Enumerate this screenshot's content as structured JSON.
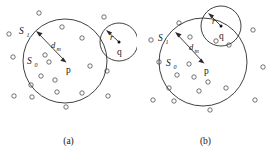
{
  "figure": {
    "background_color": "#ffffff",
    "stroke_color": "#2b2b2b",
    "text_color": "#141414",
    "width": 273,
    "height": 149,
    "panels": [
      {
        "id": "a",
        "caption": "(a)",
        "description": "Two disjoint circles: large neighborhood circle around point p and small circle of radius r around point q",
        "labels": {
          "set_outer": "S",
          "set_outer_sub": "1",
          "set_inner": "S",
          "set_inner_sub": "0",
          "distance": "d",
          "distance_sub": "m",
          "point_p": "p",
          "point_q": "q",
          "radius": "r"
        },
        "big_circle": {
          "cx": 65,
          "cy": 61,
          "r": 42
        },
        "small_circle": {
          "cx": 119,
          "cy": 42,
          "r": 19
        },
        "point_p": {
          "x": 65,
          "y": 61
        },
        "point_q": {
          "x": 119,
          "y": 42
        },
        "arrow_d": {
          "x1": 65,
          "y1": 61,
          "x2": 36,
          "y2": 31
        },
        "arrow_r": {
          "x1": 119,
          "y1": 42,
          "x2": 106,
          "y2": 30
        },
        "points": [
          {
            "x": 39,
            "y": 13
          },
          {
            "x": 9,
            "y": 34
          },
          {
            "x": 62,
            "y": 27
          },
          {
            "x": 82,
            "y": 38
          },
          {
            "x": 13,
            "y": 57
          },
          {
            "x": 49,
            "y": 62
          },
          {
            "x": 41,
            "y": 76
          },
          {
            "x": 55,
            "y": 80
          },
          {
            "x": 90,
            "y": 66
          },
          {
            "x": 31,
            "y": 85
          },
          {
            "x": 57,
            "y": 92
          },
          {
            "x": 14,
            "y": 96
          },
          {
            "x": 32,
            "y": 97
          },
          {
            "x": 82,
            "y": 93
          },
          {
            "x": 66,
            "y": 107
          },
          {
            "x": 104,
            "y": 17
          },
          {
            "x": 108,
            "y": 96
          },
          {
            "x": 107,
            "y": 71
          }
        ]
      },
      {
        "id": "b",
        "caption": "(b)",
        "description": "Two overlapping circles: large neighborhood circle around point p intersecting small circle of radius r around point q",
        "labels": {
          "set_outer": "S",
          "set_outer_sub": "1",
          "set_inner": "S",
          "set_inner_sub": "0",
          "distance": "d",
          "distance_sub": "m",
          "point_p": "p",
          "point_q": "q",
          "radius": "r"
        },
        "big_circle": {
          "cx": 66,
          "cy": 62,
          "r": 44
        },
        "small_circle": {
          "cx": 84,
          "cy": 26,
          "r": 20
        },
        "point_p": {
          "x": 66,
          "y": 62
        },
        "point_q": {
          "x": 84,
          "y": 26
        },
        "arrow_d": {
          "x1": 66,
          "y1": 62,
          "x2": 38,
          "y2": 32
        },
        "arrow_r": {
          "x1": 84,
          "y1": 26,
          "x2": 71,
          "y2": 13
        },
        "points": [
          {
            "x": 42,
            "y": 23
          },
          {
            "x": 14,
            "y": 40
          },
          {
            "x": 22,
            "y": 62
          },
          {
            "x": 53,
            "y": 37
          },
          {
            "x": 79,
            "y": 41
          },
          {
            "x": 52,
            "y": 64
          },
          {
            "x": 92,
            "y": 45
          },
          {
            "x": 116,
            "y": 30
          },
          {
            "x": 40,
            "y": 75
          },
          {
            "x": 57,
            "y": 77
          },
          {
            "x": 71,
            "y": 82
          },
          {
            "x": 32,
            "y": 88
          },
          {
            "x": 62,
            "y": 91
          },
          {
            "x": 16,
            "y": 100
          },
          {
            "x": 37,
            "y": 101
          },
          {
            "x": 89,
            "y": 88
          },
          {
            "x": 118,
            "y": 100
          },
          {
            "x": 73,
            "y": 110
          },
          {
            "x": 126,
            "y": 67
          }
        ]
      }
    ]
  }
}
